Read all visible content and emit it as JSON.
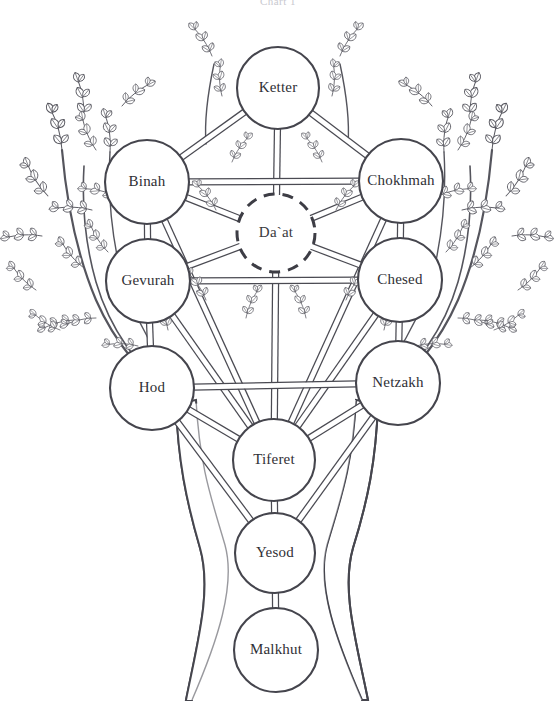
{
  "page": {
    "title_clipped": "Chart 1",
    "background_color": "#ffffff",
    "ink_color": "#45454d",
    "width": 556,
    "height": 728
  },
  "diagram": {
    "name": "Tree of Life (Kabbalistic Sefirot)",
    "style": "line drawing, white fill, dark grey outline",
    "nodes": [
      {
        "id": "ketter",
        "label": "Ketter",
        "cx": 278,
        "cy": 88,
        "r": 41,
        "dashed": false
      },
      {
        "id": "binah",
        "label": "Binah",
        "cx": 147,
        "cy": 182,
        "r": 42,
        "dashed": false
      },
      {
        "id": "chokhmah",
        "label": "Chokhmah",
        "cx": 401,
        "cy": 181,
        "r": 42,
        "dashed": false
      },
      {
        "id": "daat",
        "label": "Da`at",
        "cx": 276,
        "cy": 233,
        "r": 39,
        "dashed": true
      },
      {
        "id": "gevurah",
        "label": "Gevurah",
        "cx": 148,
        "cy": 281,
        "r": 42,
        "dashed": false
      },
      {
        "id": "chesed",
        "label": "Chesed",
        "cx": 400,
        "cy": 280,
        "r": 42,
        "dashed": false
      },
      {
        "id": "hod",
        "label": "Hod",
        "cx": 152,
        "cy": 388,
        "r": 42,
        "dashed": false
      },
      {
        "id": "netzakh",
        "label": "Netzakh",
        "cx": 398,
        "cy": 383,
        "r": 42,
        "dashed": false
      },
      {
        "id": "tiferet",
        "label": "Tiferet",
        "cx": 274,
        "cy": 460,
        "r": 41,
        "dashed": false
      },
      {
        "id": "yesod",
        "label": "Yesod",
        "cx": 275,
        "cy": 553,
        "r": 40,
        "dashed": false
      },
      {
        "id": "malkhut",
        "label": "Malkhut",
        "cx": 276,
        "cy": 650,
        "r": 42,
        "dashed": false
      }
    ],
    "paths": [
      {
        "from": "ketter",
        "to": "binah"
      },
      {
        "from": "ketter",
        "to": "chokhmah"
      },
      {
        "from": "ketter",
        "to": "daat"
      },
      {
        "from": "binah",
        "to": "chokhmah"
      },
      {
        "from": "binah",
        "to": "gevurah"
      },
      {
        "from": "binah",
        "to": "daat"
      },
      {
        "from": "binah",
        "to": "tiferet"
      },
      {
        "from": "chokhmah",
        "to": "chesed"
      },
      {
        "from": "chokhmah",
        "to": "daat"
      },
      {
        "from": "chokhmah",
        "to": "tiferet"
      },
      {
        "from": "daat",
        "to": "gevurah"
      },
      {
        "from": "daat",
        "to": "chesed"
      },
      {
        "from": "daat",
        "to": "tiferet"
      },
      {
        "from": "gevurah",
        "to": "chesed"
      },
      {
        "from": "gevurah",
        "to": "hod"
      },
      {
        "from": "gevurah",
        "to": "tiferet"
      },
      {
        "from": "chesed",
        "to": "netzakh"
      },
      {
        "from": "chesed",
        "to": "tiferet"
      },
      {
        "from": "hod",
        "to": "netzakh"
      },
      {
        "from": "hod",
        "to": "tiferet"
      },
      {
        "from": "hod",
        "to": "yesod"
      },
      {
        "from": "netzakh",
        "to": "tiferet"
      },
      {
        "from": "netzakh",
        "to": "yesod"
      },
      {
        "from": "tiferet",
        "to": "yesod"
      },
      {
        "from": "yesod",
        "to": "malkhut"
      }
    ],
    "tree": {
      "trunk_description": "wide flaring trunk, narrow waist near Yesod, splaying feet at bottom",
      "left_branch_count": 3,
      "right_branch_count": 3,
      "foliage": "small paired pointed leaves on thin twigs"
    }
  }
}
